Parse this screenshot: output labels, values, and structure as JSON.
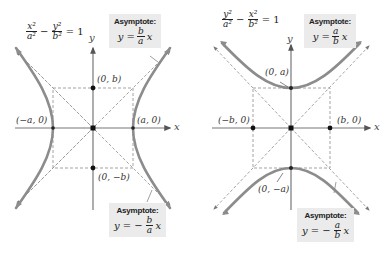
{
  "diagram": {
    "colors": {
      "curve": "#8c8c8c",
      "axis": "#777777",
      "dashed": "#999999",
      "point": "#111111",
      "asymptote_box_bg": "#ebebeb"
    },
    "left_panel": {
      "orientation": "horizontal transverse axis",
      "equation": {
        "term1_num": "x²",
        "term1_den": "a²",
        "minus": "−",
        "term2_num": "y²",
        "term2_den": "b²",
        "rhs": "= 1"
      },
      "axis_labels": {
        "x": "x",
        "y": "y"
      },
      "points": {
        "vertex_left": "(−a, 0)",
        "vertex_right": "(a, 0)",
        "co_vertex_top": "(0, b)",
        "co_vertex_bottom": "(0, −b)"
      },
      "asymptote_top": {
        "title": "Asymptote:",
        "lhs": "y =",
        "sign": "",
        "num": "b",
        "den": "a",
        "var": "x"
      },
      "asymptote_bottom": {
        "title": "Asymptote:",
        "lhs": "y =",
        "sign": "−",
        "num": "b",
        "den": "a",
        "var": "x"
      }
    },
    "right_panel": {
      "orientation": "vertical transverse axis",
      "equation": {
        "term1_num": "y²",
        "term1_den": "a²",
        "minus": "−",
        "term2_num": "x²",
        "term2_den": "b²",
        "rhs": "= 1"
      },
      "axis_labels": {
        "x": "x",
        "y": "y"
      },
      "points": {
        "vertex_top": "(0, a)",
        "vertex_bottom": "(0, −a)",
        "co_vertex_left": "(−b, 0)",
        "co_vertex_right": "(b, 0)"
      },
      "asymptote_top": {
        "title": "Asymptote:",
        "lhs": "y =",
        "sign": "",
        "num": "a",
        "den": "b",
        "var": "x"
      },
      "asymptote_bottom": {
        "title": "Asymptote:",
        "lhs": "y =",
        "sign": "−",
        "num": "a",
        "den": "b",
        "var": "x"
      }
    }
  }
}
